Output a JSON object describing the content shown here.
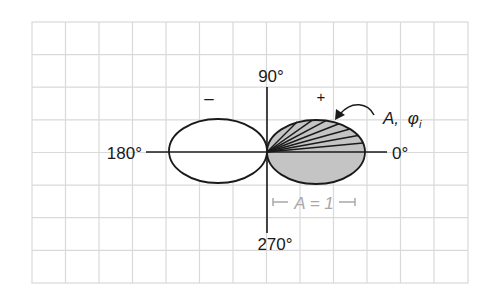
{
  "diagram": {
    "type": "polar-radiation-pattern",
    "grid": {
      "columns": 13,
      "rows": 8,
      "color": "#d9d9d9"
    },
    "axes": {
      "label_top": "90°",
      "label_left": "180°",
      "label_right": "0°",
      "label_bottom": "270°"
    },
    "lobes": [
      {
        "name": "left-lobe",
        "sign": "–",
        "fill": "#ffffff"
      },
      {
        "name": "right-lobe",
        "sign": "+",
        "fill": "#c4c4c4"
      }
    ],
    "annotation": {
      "label_A": "A,",
      "label_phi": "φ",
      "label_phi_sub": "i"
    },
    "scale_bar": {
      "label": "A = 1",
      "color": "#a8a8a8"
    },
    "colors": {
      "stroke": "#1a1a1a",
      "shaded": "#c4c4c4",
      "scale": "#a8a8a8"
    }
  }
}
